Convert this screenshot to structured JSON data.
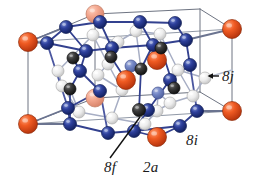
{
  "figure": {
    "kind": "crystal-structure-unit-cell",
    "background_color": "#ffffff"
  },
  "labels": {
    "site_8j": "8j",
    "site_8i": "8i",
    "site_8f": "8f",
    "site_2a": "2a"
  },
  "legend_colors": {
    "site_2a": "#e04a18",
    "site_2a_back": "#f0a08a",
    "site_8i": "#28409a",
    "site_8i_back": "#6f83c4",
    "site_8j": "#d8d8d8",
    "site_8j_back": "#e8e8e8",
    "site_8f": "#3a3a3a",
    "site_8f_back": "#8c8c8c",
    "bond_front": "#33418f",
    "bond_back": "#9aa2bb",
    "cell_edge": "#6e7482",
    "leader_line": "#111111"
  },
  "annotations": {
    "arrow_8j": "arrow pointing left to an 8j sphere",
    "leader_8f": "diagonal leader line to a dark 8f sphere"
  },
  "atoms": [
    {
      "id": "a01",
      "site": "2a",
      "x": 28,
      "y": 42,
      "r": 9.5,
      "depth": "front"
    },
    {
      "id": "a02",
      "site": "2a",
      "x": 28,
      "y": 124,
      "r": 9.5,
      "depth": "front"
    },
    {
      "id": "a03",
      "site": "2a",
      "x": 232,
      "y": 29,
      "r": 9.5,
      "depth": "front"
    },
    {
      "id": "a04",
      "site": "2a",
      "x": 232,
      "y": 111,
      "r": 9.5,
      "depth": "front"
    },
    {
      "id": "a05",
      "site": "2a",
      "x": 95,
      "y": 14,
      "r": 9.0,
      "depth": "back"
    },
    {
      "id": "a06",
      "site": "2a",
      "x": 95,
      "y": 98,
      "r": 9.0,
      "depth": "back"
    },
    {
      "id": "a07",
      "site": "2a",
      "x": 157,
      "y": 60,
      "r": 9.5,
      "depth": "front"
    },
    {
      "id": "a08",
      "site": "2a",
      "x": 126,
      "y": 80,
      "r": 9.5,
      "depth": "front"
    },
    {
      "id": "a09",
      "site": "2a",
      "x": 157,
      "y": 137,
      "r": 9.5,
      "depth": "front"
    },
    {
      "id": "b01",
      "site": "8i",
      "x": 66,
      "y": 27,
      "r": 6.5,
      "depth": "front"
    },
    {
      "id": "b02",
      "site": "8i",
      "x": 100,
      "y": 22,
      "r": 6.5,
      "depth": "front"
    },
    {
      "id": "b03",
      "site": "8i",
      "x": 140,
      "y": 22,
      "r": 6.5,
      "depth": "front"
    },
    {
      "id": "b04",
      "site": "8i",
      "x": 175,
      "y": 23,
      "r": 6.5,
      "depth": "front"
    },
    {
      "id": "b05",
      "site": "8i",
      "x": 47,
      "y": 43,
      "r": 6.5,
      "depth": "front"
    },
    {
      "id": "b06",
      "site": "8i",
      "x": 86,
      "y": 51,
      "r": 6.5,
      "depth": "front"
    },
    {
      "id": "b07",
      "site": "8i",
      "x": 112,
      "y": 48,
      "r": 6.5,
      "depth": "front"
    },
    {
      "id": "b08",
      "site": "8i",
      "x": 153,
      "y": 45,
      "r": 6.5,
      "depth": "front"
    },
    {
      "id": "b09",
      "site": "8i",
      "x": 186,
      "y": 40,
      "r": 6.5,
      "depth": "front"
    },
    {
      "id": "b10",
      "site": "8i",
      "x": 80,
      "y": 71,
      "r": 6.5,
      "depth": "front"
    },
    {
      "id": "b11",
      "site": "8i",
      "x": 100,
      "y": 91,
      "r": 6.5,
      "depth": "front"
    },
    {
      "id": "b12",
      "site": "8i",
      "x": 170,
      "y": 80,
      "r": 6.5,
      "depth": "front"
    },
    {
      "id": "b13",
      "site": "8i",
      "x": 190,
      "y": 65,
      "r": 6.5,
      "depth": "front"
    },
    {
      "id": "b14",
      "site": "8i",
      "x": 68,
      "y": 108,
      "r": 6.5,
      "depth": "front"
    },
    {
      "id": "b15",
      "site": "8i",
      "x": 108,
      "y": 133,
      "r": 6.5,
      "depth": "front"
    },
    {
      "id": "b16",
      "site": "8i",
      "x": 70,
      "y": 124,
      "r": 6.5,
      "depth": "front"
    },
    {
      "id": "b17",
      "site": "8i",
      "x": 134,
      "y": 131,
      "r": 6.5,
      "depth": "front"
    },
    {
      "id": "b18",
      "site": "8i",
      "x": 180,
      "y": 126,
      "r": 6.5,
      "depth": "front"
    },
    {
      "id": "b19",
      "site": "8i",
      "x": 197,
      "y": 111,
      "r": 6.5,
      "depth": "front"
    },
    {
      "id": "b20",
      "site": "8i",
      "x": 148,
      "y": 110,
      "r": 6.5,
      "depth": "front"
    },
    {
      "id": "b21",
      "site": "8i",
      "x": 131,
      "y": 66,
      "r": 6.0,
      "depth": "back"
    },
    {
      "id": "b22",
      "site": "8i",
      "x": 158,
      "y": 93,
      "r": 6.0,
      "depth": "back"
    },
    {
      "id": "c01",
      "site": "8j",
      "x": 93,
      "y": 35,
      "r": 6.0,
      "depth": "back"
    },
    {
      "id": "c02",
      "site": "8j",
      "x": 118,
      "y": 42,
      "r": 6.0,
      "depth": "back"
    },
    {
      "id": "c03",
      "site": "8j",
      "x": 136,
      "y": 31,
      "r": 6.0,
      "depth": "back"
    },
    {
      "id": "c04",
      "site": "8j",
      "x": 160,
      "y": 34,
      "r": 6.0,
      "depth": "back"
    },
    {
      "id": "c05",
      "site": "8j",
      "x": 58,
      "y": 71,
      "r": 6.0,
      "depth": "back"
    },
    {
      "id": "c06",
      "site": "8j",
      "x": 62,
      "y": 86,
      "r": 6.0,
      "depth": "back"
    },
    {
      "id": "c07",
      "site": "8j",
      "x": 108,
      "y": 64,
      "r": 6.0,
      "depth": "back"
    },
    {
      "id": "c08",
      "site": "8j",
      "x": 122,
      "y": 90,
      "r": 6.0,
      "depth": "back"
    },
    {
      "id": "c09",
      "site": "8j",
      "x": 178,
      "y": 70,
      "r": 6.0,
      "depth": "back"
    },
    {
      "id": "c10",
      "site": "8j",
      "x": 205,
      "y": 78,
      "r": 6.0,
      "depth": "back"
    },
    {
      "id": "c11",
      "site": "8j",
      "x": 193,
      "y": 96,
      "r": 6.0,
      "depth": "back"
    },
    {
      "id": "c12",
      "site": "8j",
      "x": 79,
      "y": 112,
      "r": 6.0,
      "depth": "back"
    },
    {
      "id": "c13",
      "site": "8j",
      "x": 112,
      "y": 118,
      "r": 6.0,
      "depth": "back"
    },
    {
      "id": "c14",
      "site": "8j",
      "x": 145,
      "y": 124,
      "r": 6.0,
      "depth": "back"
    },
    {
      "id": "c15",
      "site": "8j",
      "x": 157,
      "y": 111,
      "r": 6.0,
      "depth": "back"
    },
    {
      "id": "c16",
      "site": "8j",
      "x": 170,
      "y": 103,
      "r": 6.0,
      "depth": "back"
    },
    {
      "id": "c17",
      "site": "8j",
      "x": 98,
      "y": 75,
      "r": 6.0,
      "depth": "back"
    },
    {
      "id": "d01",
      "site": "8f",
      "x": 73,
      "y": 58,
      "r": 6.0,
      "depth": "front"
    },
    {
      "id": "d02",
      "site": "8f",
      "x": 70,
      "y": 89,
      "r": 6.0,
      "depth": "front"
    },
    {
      "id": "d03",
      "site": "8f",
      "x": 111,
      "y": 57,
      "r": 6.0,
      "depth": "front"
    },
    {
      "id": "d04",
      "site": "8f",
      "x": 141,
      "y": 69,
      "r": 6.0,
      "depth": "front"
    },
    {
      "id": "d05",
      "site": "8f",
      "x": 139,
      "y": 110,
      "r": 6.5,
      "depth": "front"
    },
    {
      "id": "d06",
      "site": "8f",
      "x": 161,
      "y": 48,
      "r": 6.0,
      "depth": "front"
    },
    {
      "id": "d07",
      "site": "8f",
      "x": 174,
      "y": 88,
      "r": 6.0,
      "depth": "front"
    }
  ]
}
